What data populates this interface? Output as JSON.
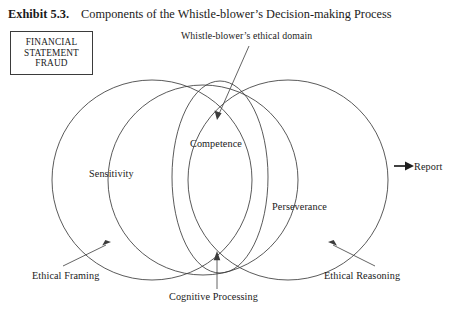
{
  "header": {
    "exhibit_number": "Exhibit 5.3.",
    "exhibit_title": "Components of the Whistle-blower’s Decision-making Process"
  },
  "fraud_box": {
    "line1": "FINANCIAL",
    "line2": "STATEMENT",
    "line3": "FRAUD"
  },
  "diagram": {
    "regions": [
      {
        "label": "Sensitivity"
      },
      {
        "label": "Competence"
      },
      {
        "label": "Perseverance"
      }
    ],
    "annotation": "Whistle-blower’s ethical domain",
    "callouts": [
      {
        "label": "Ethical Framing"
      },
      {
        "label": "Cognitive Processing"
      },
      {
        "label": "Ethical Reasoning"
      }
    ],
    "output": "Report",
    "colors": {
      "stroke": "#3c3c3c",
      "text": "#1a1a1a",
      "box_border": "#3b3b3b",
      "background": "#ffffff"
    }
  }
}
